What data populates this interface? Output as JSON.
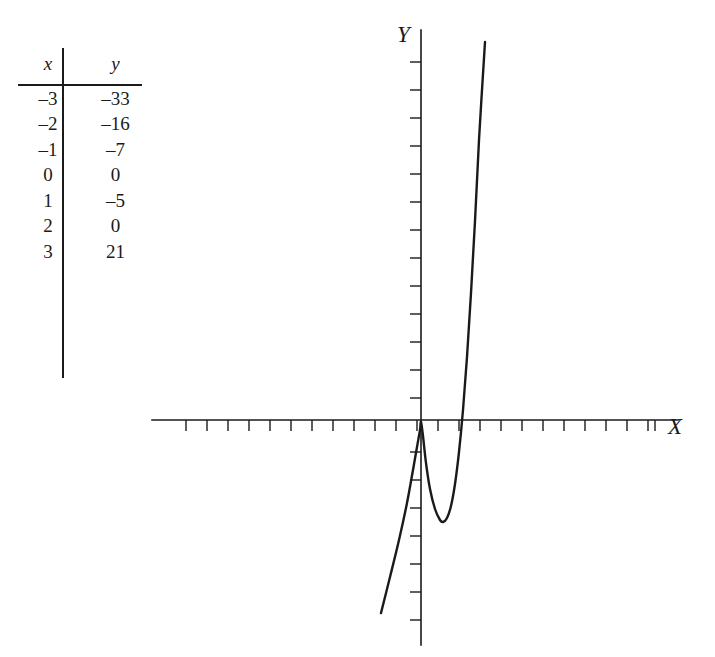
{
  "figure": {
    "name": "cubic-function-table-and-graph",
    "ink_color": "#1a1a1a",
    "background": "#ffffff"
  },
  "table": {
    "headers": [
      "x",
      "y"
    ],
    "rows": [
      {
        "x": "–3",
        "y": "–33"
      },
      {
        "x": "–2",
        "y": "–16"
      },
      {
        "x": "–1",
        "y": "–7"
      },
      {
        "x": "0",
        "y": "0"
      },
      {
        "x": "1",
        "y": "–5"
      },
      {
        "x": "2",
        "y": "0"
      },
      {
        "x": "3",
        "y": "21"
      }
    ]
  },
  "graph": {
    "x_axis_label": "X",
    "y_axis_label": "Y",
    "x_tick_count": 24,
    "y_tick_count": 22
  },
  "chart_data": {
    "type": "line",
    "title": "",
    "xlabel": "X",
    "ylabel": "Y",
    "grid": false,
    "legend": false,
    "axis_ticks_labeled": false,
    "origin_px": [
      421,
      420
    ],
    "px_per_x_unit": 21,
    "px_per_y_unit": 28,
    "table_points": {
      "x": [
        -3,
        -2,
        -1,
        0,
        1,
        2,
        3
      ],
      "y": [
        -33,
        -16,
        -7,
        0,
        -5,
        0,
        21
      ]
    },
    "curve_px": [
      [
        381,
        613
      ],
      [
        390,
        577
      ],
      [
        399,
        540
      ],
      [
        407,
        503
      ],
      [
        413,
        470
      ],
      [
        417,
        447
      ],
      [
        420,
        430
      ],
      [
        421,
        422
      ],
      [
        423,
        436
      ],
      [
        426,
        463
      ],
      [
        430,
        489
      ],
      [
        435,
        509
      ],
      [
        440,
        520
      ],
      [
        443,
        522
      ],
      [
        447,
        518
      ],
      [
        451,
        506
      ],
      [
        455,
        484
      ],
      [
        459,
        452
      ],
      [
        463,
        410
      ],
      [
        467,
        357
      ],
      [
        471,
        293
      ],
      [
        475,
        221
      ],
      [
        479,
        140
      ],
      [
        485,
        42
      ]
    ],
    "x_ticks_px": [
      186,
      207,
      228,
      249,
      270,
      291,
      312,
      333,
      354,
      375,
      396,
      417,
      438,
      459,
      480,
      501,
      522,
      543,
      564,
      585,
      606,
      627,
      648,
      655
    ],
    "y_ticks_px": [
      62,
      90,
      118,
      146,
      174,
      202,
      230,
      258,
      286,
      314,
      342,
      370,
      398,
      452,
      480,
      508,
      536,
      564,
      592,
      620
    ],
    "x_axis_extent_px": [
      152,
      678
    ],
    "y_axis_extent_px": [
      30,
      645
    ]
  }
}
